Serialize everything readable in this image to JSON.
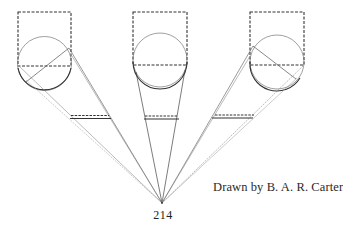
{
  "figure": {
    "caption": "Drawn by B. A. R. Carter",
    "page_number": "214",
    "colors": {
      "ink": "#333333",
      "light_ink": "#8a8a8a",
      "background": "#ffffff"
    },
    "apex": {
      "x": 162,
      "y": 203
    },
    "views": [
      {
        "name": "left",
        "square": {
          "x": 18,
          "y": 12,
          "w": 53,
          "h": 54
        },
        "circle": {
          "cx": 44.5,
          "cy": 63.5,
          "r": 27
        },
        "bar": {
          "x1": 70,
          "x2": 110,
          "y": 115
        }
      },
      {
        "name": "center",
        "square": {
          "x": 133,
          "y": 12,
          "w": 54,
          "h": 53
        },
        "circle": {
          "cx": 160,
          "cy": 60,
          "r": 27
        },
        "bar": {
          "x1": 144,
          "x2": 178,
          "y": 116
        }
      },
      {
        "name": "right",
        "square": {
          "x": 250,
          "y": 12,
          "w": 54,
          "h": 53
        },
        "circle": {
          "cx": 277,
          "cy": 62,
          "r": 27
        },
        "bar": {
          "x1": 212,
          "x2": 254,
          "y": 115
        }
      }
    ]
  }
}
